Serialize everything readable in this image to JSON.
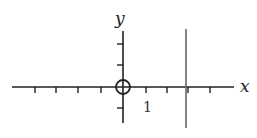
{
  "diagram": {
    "x_axis_label": "x",
    "y_axis_label": "y",
    "tick_label": "1",
    "x_ticks": [
      -4,
      -3,
      -2,
      -1,
      1,
      2,
      3,
      4
    ],
    "y_ticks": [
      2,
      1,
      -1
    ],
    "open_point": {
      "x": 0,
      "y": 0
    },
    "vertical_line": {
      "x": 3
    },
    "colors": {
      "axis": "#222222",
      "vertical_line": "#666666"
    }
  }
}
